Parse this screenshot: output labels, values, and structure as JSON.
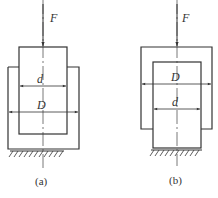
{
  "figure_a": {
    "force_label": "F",
    "inner_dim_label": "d",
    "outer_dim_label": "D",
    "caption": "(a)"
  },
  "figure_b": {
    "force_label": "F",
    "outer_dim_label": "D",
    "inner_dim_label": "d",
    "caption": "(b)"
  },
  "colors": {
    "line": "#333333",
    "background": "#ffffff"
  }
}
